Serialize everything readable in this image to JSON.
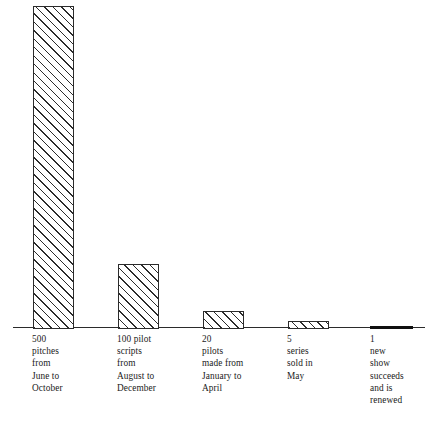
{
  "chart_data": {
    "type": "bar",
    "title": "",
    "subtitle": "",
    "xlabel": "",
    "ylabel": "",
    "grid": false,
    "legend": null,
    "ylim": [
      0,
      500
    ],
    "axis_visible": {
      "x": true,
      "y": false
    },
    "categories": [
      "500 pitches from June to October",
      "100 pilot scripts from August to December",
      "20 pilots made from January to April",
      "5 series sold in May",
      "1 new show succeeds and is renewed"
    ],
    "values": [
      500,
      100,
      20,
      5,
      1
    ],
    "tick_labels": [
      "500\npitches\nfrom\nJune to\nOctober",
      "100 pilot\nscripts\nfrom\nAugust to\nDecember",
      "20\npilots\nmade from\nJanuary to\nApril",
      "5\nseries\nsold in\nMay",
      "1\nnew\nshow\nsucceeds\nand is\nrenewed"
    ],
    "bar_style": {
      "fill": "#ffffff",
      "hatch": "forward-diagonal",
      "edge_color": "#2b2b2b",
      "last_bar_fill": "#101010"
    }
  },
  "bars": [
    {
      "name": "bar-500-pitches",
      "value": 500,
      "left_px": 33,
      "width_px": 41,
      "height_px": 323,
      "solid": false,
      "label": "500\npitches\nfrom\nJune to\nOctober",
      "label_left_px": 32
    },
    {
      "name": "bar-100-pilot-scripts",
      "value": 100,
      "left_px": 118,
      "width_px": 41,
      "height_px": 65,
      "solid": false,
      "label": "100 pilot\nscripts\nfrom\nAugust to\nDecember",
      "label_left_px": 117
    },
    {
      "name": "bar-20-pilots",
      "value": 20,
      "left_px": 203,
      "width_px": 41,
      "height_px": 18,
      "solid": false,
      "label": "20\npilots\nmade from\nJanuary to\nApril",
      "label_left_px": 202
    },
    {
      "name": "bar-5-series",
      "value": 5,
      "left_px": 288,
      "width_px": 41,
      "height_px": 8,
      "solid": false,
      "label": "5\nseries\nsold in\nMay",
      "label_left_px": 287
    },
    {
      "name": "bar-1-new-show",
      "value": 1,
      "left_px": 370,
      "width_px": 43,
      "height_px": 3,
      "solid": true,
      "label": "1\nnew\nshow\nsucceeds\nand is\nrenewed",
      "label_left_px": 370
    }
  ]
}
